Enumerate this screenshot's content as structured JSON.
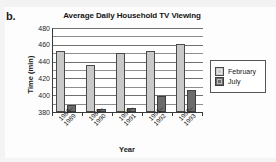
{
  "part_label": "b.",
  "chart_data": {
    "type": "bar",
    "title": "Average Daily Household TV Viewing",
    "xlabel": "Year",
    "ylabel": "Time (min)",
    "categories": [
      "1988–1989",
      "1989–1990",
      "1990–1991",
      "1991–1992",
      "1992–1993"
    ],
    "category_lines": [
      [
        "1988–",
        "1989"
      ],
      [
        "1989–",
        "1990"
      ],
      [
        "1990–",
        "1991"
      ],
      [
        "1991–",
        "1992"
      ],
      [
        "1992–",
        "1993"
      ]
    ],
    "series": [
      {
        "name": "February",
        "color": "#c9c9c9",
        "values": [
          453,
          436,
          450,
          453,
          461
        ]
      },
      {
        "name": "July",
        "color": "#6b6b6b",
        "values": [
          388,
          384,
          385,
          399,
          406
        ]
      }
    ],
    "ylim": [
      380,
      480
    ],
    "yticks": [
      380,
      400,
      420,
      440,
      460,
      480
    ],
    "ytick_labels": [
      "380",
      "400",
      "420",
      "440",
      "460",
      "480"
    ],
    "minor_tick_step": 10,
    "grid": true,
    "legend_position": "right"
  },
  "legend": {
    "entries": [
      {
        "label": "February",
        "swatch": "feb"
      },
      {
        "label": "July",
        "swatch": "jul"
      }
    ]
  }
}
